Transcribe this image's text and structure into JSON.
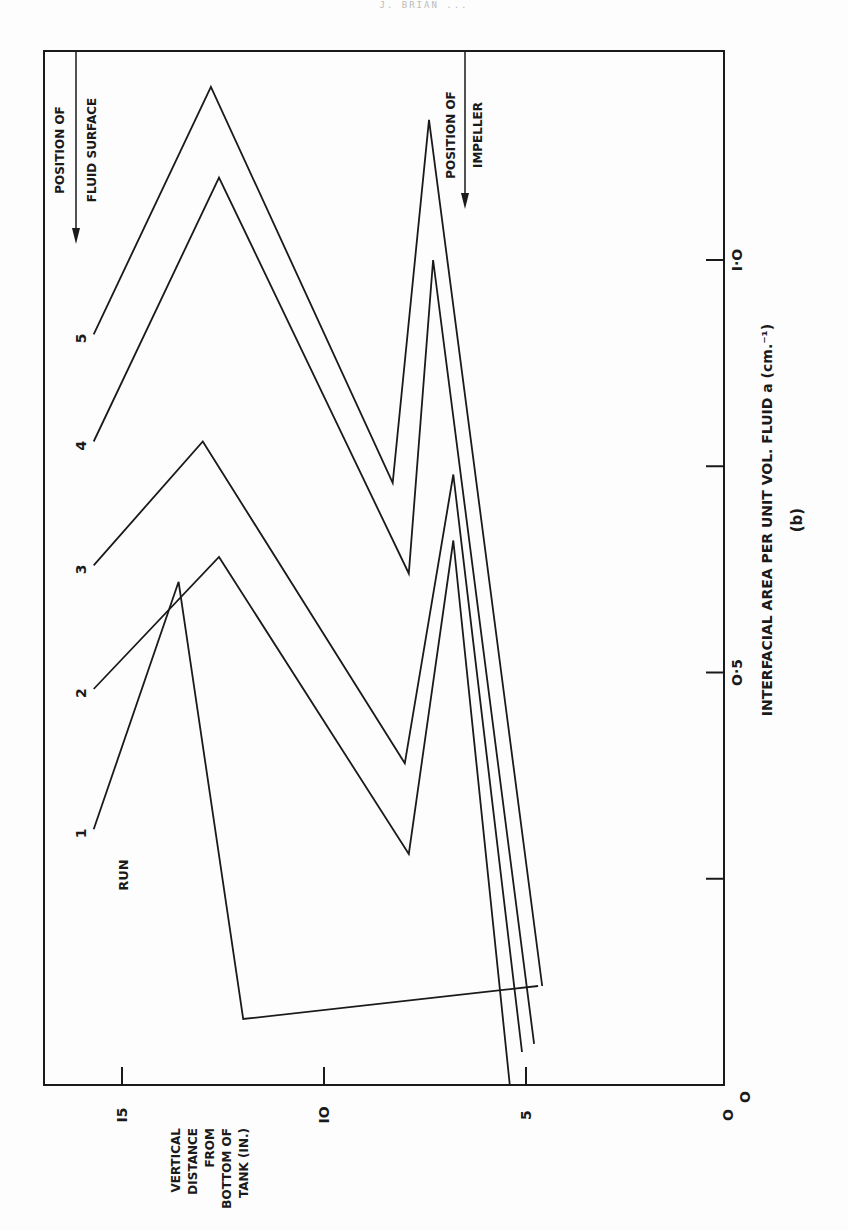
{
  "page": {
    "running_header": "J. BRIAN ...",
    "figure_caption": "(b)"
  },
  "axes": {
    "x_label": "INTERFACIAL AREA PER UNIT VOL. FLUID a  (cm.⁻¹)",
    "y_label_lines": [
      "VERTICAL",
      "DISTANCE",
      "FROM",
      "BOTTOM OF",
      "TANK (IN.)"
    ],
    "x_ticks": [
      {
        "value": 0,
        "label": "O"
      },
      {
        "value": 0.25,
        "label": ""
      },
      {
        "value": 0.5,
        "label": "O·5"
      },
      {
        "value": 0.75,
        "label": ""
      },
      {
        "value": 1.0,
        "label": "I·O"
      }
    ],
    "y_ticks": [
      {
        "value": 0,
        "label": "O"
      },
      {
        "value": 5,
        "label": "5"
      },
      {
        "value": 10,
        "label": "IO"
      },
      {
        "value": 15,
        "label": "I5"
      }
    ]
  },
  "annotations": {
    "run_label": "RUN",
    "fluid_surface": [
      "POSITION OF",
      "FLUID SURFACE"
    ],
    "impeller": [
      "POSITION OF",
      "IMPELLER"
    ]
  },
  "chart_data": {
    "type": "line",
    "title": "",
    "subtitle": "(b)",
    "xlabel": "Interfacial area per unit vol. fluid a (cm.^-1)",
    "ylabel": "Vertical distance from bottom of tank (in.)",
    "xlim": [
      0,
      1.25
    ],
    "ylim": [
      0,
      17.5
    ],
    "orientation_note": "figure printed rotated 90° counter-clockwise; distance axis runs along page bottom, area axis along page right",
    "grid": false,
    "legend": "inline run labels 1–5 at top of each curve",
    "reference_lines": [
      {
        "label": "Position of fluid surface",
        "y": 15.0
      },
      {
        "label": "Position of impeller",
        "y": 6.4
      }
    ],
    "series": [
      {
        "name": "Run 1",
        "label": "1",
        "points": [
          [
            0.31,
            15.7
          ],
          [
            0.61,
            13.6
          ],
          [
            0.08,
            12.0
          ],
          [
            0.12,
            4.7
          ]
        ]
      },
      {
        "name": "Run 2",
        "label": "2",
        "points": [
          [
            0.48,
            15.7
          ],
          [
            0.64,
            12.6
          ],
          [
            0.28,
            7.9
          ],
          [
            0.66,
            6.8
          ],
          [
            0.0,
            5.4
          ]
        ]
      },
      {
        "name": "Run 3",
        "label": "3",
        "points": [
          [
            0.63,
            15.7
          ],
          [
            0.78,
            13.0
          ],
          [
            0.39,
            8.0
          ],
          [
            0.74,
            6.8
          ],
          [
            0.04,
            5.1
          ]
        ]
      },
      {
        "name": "Run 4",
        "label": "4",
        "points": [
          [
            0.78,
            15.7
          ],
          [
            1.1,
            12.6
          ],
          [
            0.62,
            7.9
          ],
          [
            1.0,
            7.3
          ],
          [
            0.05,
            4.8
          ]
        ]
      },
      {
        "name": "Run 5",
        "label": "5",
        "points": [
          [
            0.91,
            15.7
          ],
          [
            1.21,
            12.8
          ],
          [
            0.73,
            8.3
          ],
          [
            1.17,
            7.4
          ],
          [
            0.12,
            4.6
          ]
        ]
      }
    ]
  }
}
